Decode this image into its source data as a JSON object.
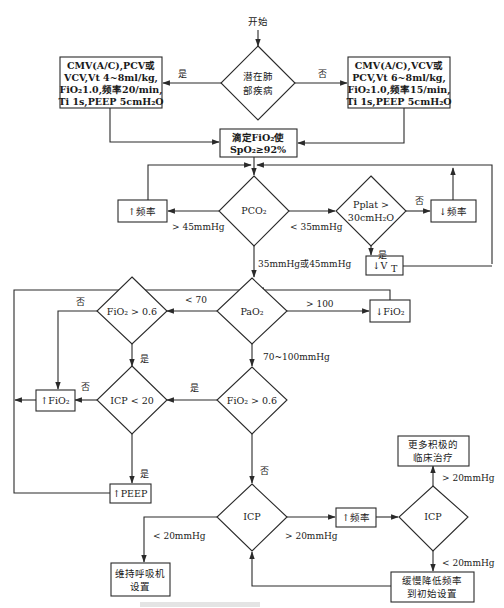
{
  "diagram": {
    "type": "flowchart",
    "colors": {
      "line": "#2a2a2a",
      "background": "#ffffff",
      "text": "#1a1a1a"
    },
    "start": {
      "label": "开始"
    },
    "nodes": {
      "lung_disease": {
        "shape": "diamond",
        "lines": [
          "潜在肺",
          "部疾病"
        ]
      },
      "left_setting": {
        "shape": "box",
        "lines": [
          "CMV(A/C),PCV或",
          "VCV,Vt 4~8ml/kg,",
          "FiO₂1.0,频率20/min,",
          "Ti 1s,PEEP 5cmH₂O"
        ]
      },
      "right_setting": {
        "shape": "box",
        "lines": [
          "CMV(A/C),VCV或",
          "PCV,Vt 6~8ml/kg,",
          "FiO₂1.0,频率15/min,",
          "Ti 1s,PEEP 5cmH₂O"
        ]
      },
      "titrate": {
        "shape": "box",
        "lines": [
          "滴定FiO₂使",
          "SpO₂≥92%"
        ]
      },
      "pco2": {
        "shape": "diamond",
        "label": "PCO₂"
      },
      "inc_rate_1": {
        "shape": "box",
        "label": "↑频率"
      },
      "pplat": {
        "shape": "diamond",
        "lines": [
          "Pplat >",
          "30cmH₂O"
        ]
      },
      "dec_rate": {
        "shape": "box",
        "label": "↓频率"
      },
      "dec_vt": {
        "shape": "box",
        "label": "↓V",
        "sub": "T"
      },
      "pao2": {
        "shape": "diamond",
        "label": "PaO₂"
      },
      "fio2_gt_upper": {
        "shape": "diamond",
        "label": "FiO₂ > 0.6"
      },
      "dec_fio2": {
        "shape": "box",
        "label": "↓FiO₂"
      },
      "icp_lt_20": {
        "shape": "diamond",
        "label": "ICP < 20"
      },
      "inc_fio2": {
        "shape": "box",
        "label": "↑FiO₂"
      },
      "fio2_gt_lower": {
        "shape": "diamond",
        "label": "FiO₂ > 0.6"
      },
      "inc_peep": {
        "shape": "box",
        "label": "↑PEEP"
      },
      "icp_main": {
        "shape": "diamond",
        "label": "ICP"
      },
      "maintain": {
        "shape": "box",
        "lines": [
          "维持呼吸机",
          "设置"
        ]
      },
      "inc_rate_2": {
        "shape": "box",
        "label": "↑频率"
      },
      "icp_right": {
        "shape": "diamond",
        "label": "ICP"
      },
      "aggressive": {
        "shape": "box",
        "lines": [
          "更多积极的",
          "临床治疗"
        ]
      },
      "slow_reduce": {
        "shape": "box",
        "lines": [
          "缓慢降低频率",
          "到初始设置"
        ]
      }
    },
    "edge_labels": {
      "lung_yes": "是",
      "lung_no": "否",
      "pco2_high": "> 45mmHg",
      "pco2_low": "< 35mmHg",
      "pco2_normal": "35mmHg或45mmHg",
      "pplat_no": "否",
      "pplat_yes": "是",
      "pao2_low": "< 70",
      "pao2_high": "> 100",
      "pao2_normal": "70~100mmHg",
      "fio2_upper_no": "否",
      "fio2_upper_yes": "是",
      "icp20_no": "否",
      "icp20_yes": "是",
      "fio2_lower_yes": "是",
      "fio2_lower_no": "否",
      "icp_main_low": "< 20mmHg",
      "icp_main_high": "> 20mmHg",
      "icp_right_high": "> 20mmHg",
      "icp_right_low": "< 20mmHg"
    }
  }
}
